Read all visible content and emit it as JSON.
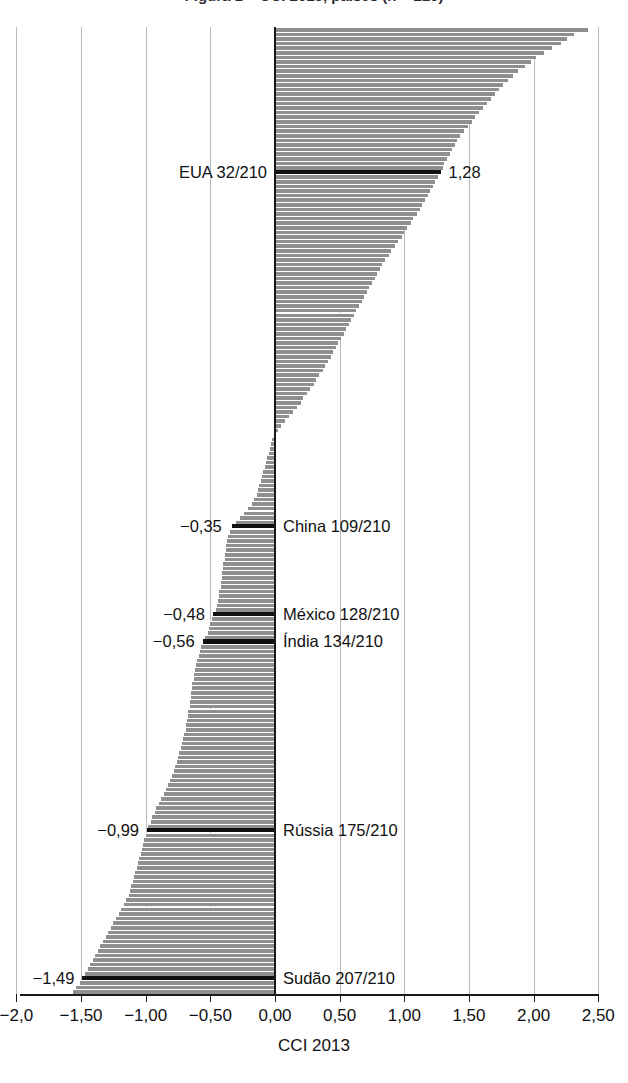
{
  "chart_data": {
    "type": "bar",
    "orientation": "horizontal",
    "title": "Figura 1 – CCI 2013, países (n = 210)",
    "xlabel": "CCI 2013",
    "ylabel": "",
    "xlim": [
      -2.0,
      2.5
    ],
    "grid": true,
    "legend": "none",
    "n_items": 210,
    "xticks": [
      -2.0,
      -1.5,
      -1.0,
      -0.5,
      0.0,
      0.5,
      1.0,
      1.5,
      2.0,
      2.5
    ],
    "xticklabels": [
      "-2,0",
      "-1,50",
      "-1,00",
      "-0,50",
      "0,00",
      "0,50",
      "1,00",
      "1,50",
      "2,00",
      "2,50"
    ],
    "sorted": "descending",
    "max_value": 2.42,
    "min_value": -1.56,
    "zero_crossing_rank": 88,
    "highlighted": [
      {
        "label": "EUA 32/210",
        "country": "EUA",
        "rank": 32,
        "total": 210,
        "value": 1.28,
        "value_label": "1,28",
        "label_side": "left",
        "value_side": "right"
      },
      {
        "label": "China 109/210",
        "country": "China",
        "rank": 109,
        "total": 210,
        "value": -0.35,
        "value_label": "-0,35",
        "label_side": "right",
        "value_side": "left"
      },
      {
        "label": "México 128/210",
        "country": "México",
        "rank": 128,
        "total": 210,
        "value": -0.48,
        "value_label": "-0,48",
        "label_side": "right",
        "value_side": "left"
      },
      {
        "label": "Índia 134/210",
        "country": "Índia",
        "rank": 134,
        "total": 210,
        "value": -0.56,
        "value_label": "-0,56",
        "label_side": "right",
        "value_side": "left"
      },
      {
        "label": "Rússia 175/210",
        "country": "Rússia",
        "rank": 175,
        "total": 210,
        "value": -0.99,
        "value_label": "-0,99",
        "label_side": "right",
        "value_side": "left"
      },
      {
        "label": "Sudão 207/210",
        "country": "Sudão",
        "rank": 207,
        "total": 210,
        "value": -1.49,
        "value_label": "-1,49",
        "label_side": "right",
        "value_side": "left"
      }
    ],
    "values": [
      2.42,
      2.31,
      2.26,
      2.21,
      2.14,
      2.08,
      2.02,
      1.98,
      1.93,
      1.88,
      1.84,
      1.8,
      1.76,
      1.73,
      1.7,
      1.67,
      1.64,
      1.61,
      1.58,
      1.55,
      1.52,
      1.49,
      1.46,
      1.43,
      1.41,
      1.39,
      1.37,
      1.35,
      1.33,
      1.31,
      1.3,
      1.28,
      1.26,
      1.24,
      1.22,
      1.2,
      1.18,
      1.16,
      1.14,
      1.12,
      1.1,
      1.07,
      1.05,
      1.02,
      1.0,
      0.98,
      0.95,
      0.93,
      0.9,
      0.88,
      0.85,
      0.83,
      0.81,
      0.79,
      0.77,
      0.75,
      0.73,
      0.71,
      0.69,
      0.67,
      0.65,
      0.63,
      0.61,
      0.59,
      0.57,
      0.55,
      0.53,
      0.51,
      0.49,
      0.47,
      0.45,
      0.43,
      0.41,
      0.39,
      0.37,
      0.34,
      0.32,
      0.3,
      0.27,
      0.25,
      0.22,
      0.2,
      0.17,
      0.14,
      0.11,
      0.08,
      0.05,
      0.02,
      -0.01,
      -0.02,
      -0.03,
      -0.04,
      -0.05,
      -0.06,
      -0.07,
      -0.08,
      -0.09,
      -0.1,
      -0.11,
      -0.12,
      -0.13,
      -0.14,
      -0.16,
      -0.18,
      -0.21,
      -0.24,
      -0.27,
      -0.3,
      -0.33,
      -0.35,
      -0.36,
      -0.37,
      -0.38,
      -0.38,
      -0.39,
      -0.39,
      -0.4,
      -0.4,
      -0.41,
      -0.41,
      -0.42,
      -0.42,
      -0.43,
      -0.43,
      -0.44,
      -0.45,
      -0.46,
      -0.48,
      -0.49,
      -0.5,
      -0.51,
      -0.52,
      -0.54,
      -0.56,
      -0.57,
      -0.58,
      -0.59,
      -0.6,
      -0.61,
      -0.62,
      -0.63,
      -0.63,
      -0.64,
      -0.64,
      -0.65,
      -0.65,
      -0.66,
      -0.66,
      -0.67,
      -0.67,
      -0.68,
      -0.69,
      -0.69,
      -0.7,
      -0.71,
      -0.72,
      -0.73,
      -0.74,
      -0.75,
      -0.76,
      -0.77,
      -0.78,
      -0.8,
      -0.81,
      -0.83,
      -0.84,
      -0.86,
      -0.88,
      -0.9,
      -0.92,
      -0.93,
      -0.95,
      -0.96,
      -0.98,
      -0.99,
      -1.0,
      -1.01,
      -1.02,
      -1.03,
      -1.04,
      -1.05,
      -1.06,
      -1.07,
      -1.08,
      -1.09,
      -1.1,
      -1.11,
      -1.12,
      -1.13,
      -1.15,
      -1.17,
      -1.19,
      -1.21,
      -1.23,
      -1.25,
      -1.27,
      -1.29,
      -1.31,
      -1.33,
      -1.35,
      -1.37,
      -1.39,
      -1.41,
      -1.43,
      -1.45,
      -1.47,
      -1.49,
      -1.51,
      -1.54,
      -1.56
    ]
  },
  "colors": {
    "bar": "#8f8f8f",
    "highlight": "#111111",
    "grid": "#b9b9b9",
    "axis": "#1a1a1a",
    "background": "#ffffff"
  }
}
